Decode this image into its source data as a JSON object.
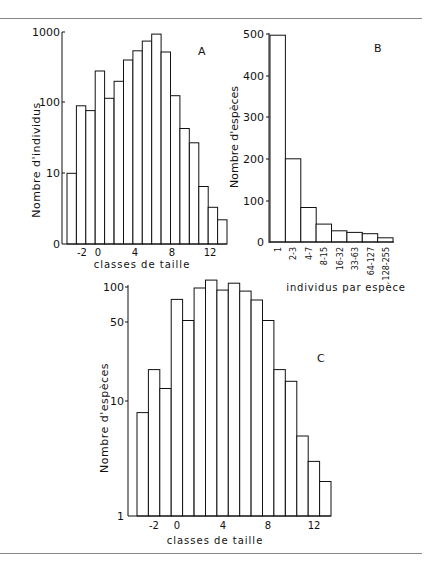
{
  "chart_data": [
    {
      "id": "A",
      "type": "bar",
      "panel_label": "A",
      "title": "",
      "xlabel": "classes de taille",
      "ylabel": "Nombre d'individus",
      "yscale": "log",
      "ylim": [
        1,
        1000
      ],
      "yticks": [
        {
          "value": 1,
          "label": "0"
        },
        {
          "value": 10,
          "label": "10"
        },
        {
          "value": 100,
          "label": "100"
        },
        {
          "value": 1000,
          "label": "1000"
        }
      ],
      "xticks": [
        "-2",
        "0",
        "4",
        "8",
        "12"
      ],
      "categories": [
        -3,
        -2,
        -1,
        0,
        1,
        2,
        3,
        4,
        5,
        6,
        7,
        8,
        9,
        10,
        11,
        12,
        13
      ],
      "values": [
        10,
        90,
        77,
        280,
        115,
        200,
        400,
        540,
        740,
        930,
        520,
        125,
        43,
        27,
        6.5,
        3.3,
        2.2
      ],
      "grid": false,
      "legend": null
    },
    {
      "id": "B",
      "type": "bar",
      "panel_label": "B",
      "title": "",
      "xlabel": "individus par espèce",
      "ylabel": "Nombre d'espèces",
      "yscale": "linear",
      "ylim": [
        0,
        500
      ],
      "yticks": [
        0,
        100,
        200,
        300,
        400,
        500
      ],
      "categories": [
        "1",
        "2-3",
        "4-7",
        "8-15",
        "16-32",
        "33-63",
        "64-127",
        "128-255"
      ],
      "values": [
        497,
        200,
        83,
        43,
        27,
        23,
        20,
        10
      ],
      "grid": false,
      "legend": null
    },
    {
      "id": "C",
      "type": "bar",
      "panel_label": "C",
      "title": "",
      "xlabel": "classes de taille",
      "ylabel": "Nombre d'espèces",
      "yscale": "log",
      "ylim": [
        1,
        120
      ],
      "yticks": [
        {
          "value": 1,
          "label": "1"
        },
        {
          "value": 10,
          "label": "10"
        },
        {
          "value": 50,
          "label": "50"
        },
        {
          "value": 100,
          "label": "100"
        }
      ],
      "xticks": [
        "-2",
        "0",
        "4",
        "8",
        "12"
      ],
      "categories": [
        -3,
        -2,
        -1,
        0,
        1,
        2,
        3,
        4,
        5,
        6,
        7,
        8,
        9,
        10,
        11,
        12,
        13
      ],
      "values": [
        8,
        19,
        13,
        78,
        51,
        98,
        115,
        94,
        108,
        92,
        77,
        51,
        19,
        15,
        5,
        3,
        2
      ],
      "grid": false,
      "legend": null
    }
  ],
  "labels": {
    "A": {
      "panel": "A",
      "xlabel": "classes de taille",
      "ylabel": "Nombre   d'individus",
      "ytick_1000": "1000",
      "ytick_100": "100",
      "ytick_10": "10",
      "ytick_0": "0",
      "xt_m2": "-2",
      "xt_0": "0",
      "xt_4": "4",
      "xt_8": "8",
      "xt_12": "12"
    },
    "B": {
      "panel": "B",
      "xlabel": "individus par espèce",
      "ylabel": "Nombre d'espèces",
      "y500": "500",
      "y400": "400",
      "y300": "300",
      "y200": "200",
      "y100": "100",
      "y0": "0",
      "c1": "1",
      "c2": "2-3",
      "c3": "4-7",
      "c4": "8-15",
      "c5": "16-32",
      "c6": "33-63",
      "c7": "64-127",
      "c8": "128-255"
    },
    "C": {
      "panel": "C",
      "xlabel": "classes de taille",
      "ylabel": "Nombre  d'espèces",
      "y100": "100",
      "y50": "50",
      "y10": "10",
      "y1": "1",
      "xt_m2": "-2",
      "xt_0": "0",
      "xt_4": "4",
      "xt_8": "8",
      "xt_12": "12"
    }
  }
}
